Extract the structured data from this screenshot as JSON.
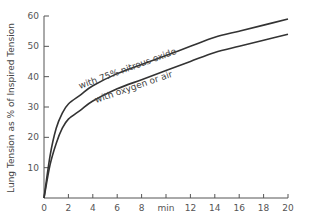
{
  "chart_data": {
    "type": "line",
    "title": "",
    "xlabel": "min",
    "ylabel": "Lung Tension as % of Inspired Tension",
    "xlim": [
      0,
      20
    ],
    "ylim": [
      0,
      60
    ],
    "x_ticks": [
      "0",
      "2",
      "4",
      "6",
      "8",
      "min",
      "12",
      "14",
      "16",
      "18",
      "20"
    ],
    "y_ticks": [
      "10",
      "20",
      "30",
      "40",
      "50",
      "60"
    ],
    "grid": false,
    "legend": "inline labels on curves",
    "series": [
      {
        "name": "with 75% nitrous oxide",
        "x": [
          0,
          0.5,
          1,
          1.5,
          2,
          3,
          4,
          6,
          8,
          10,
          12,
          14,
          16,
          18,
          20
        ],
        "values": [
          0,
          14,
          23,
          28,
          31,
          34,
          37,
          41,
          44,
          47,
          50,
          53,
          55,
          57,
          59
        ]
      },
      {
        "name": "with oxygen or air",
        "x": [
          0,
          0.5,
          1,
          1.5,
          2,
          3,
          4,
          6,
          8,
          10,
          12,
          14,
          16,
          18,
          20
        ],
        "values": [
          0,
          11,
          18,
          23,
          26,
          29,
          32,
          36,
          39,
          42,
          45,
          48,
          50,
          52,
          54
        ]
      }
    ]
  },
  "labels": {
    "nitrous": "with 75% nitrous oxide",
    "oxygen": "with oxygen or air",
    "ylabel": "Lung Tension as % of Inspired Tension"
  },
  "colors": {
    "line": "#333333",
    "axis": "#555555"
  }
}
